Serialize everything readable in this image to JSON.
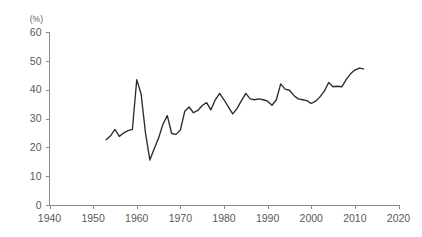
{
  "chart_data": {
    "type": "line",
    "title": "",
    "xlabel": "",
    "ylabel": "(%)",
    "unit_label": "(%)",
    "xlim": [
      1940,
      2020
    ],
    "ylim": [
      0,
      60
    ],
    "xticks": [
      1940,
      1950,
      1960,
      1970,
      1980,
      1990,
      2000,
      2010,
      2020
    ],
    "yticks": [
      0,
      10,
      20,
      30,
      40,
      50,
      60
    ],
    "xtick_labels": [
      "1940",
      "1950",
      "1960",
      "1970",
      "1980",
      "1990",
      "2000",
      "2010",
      "2020"
    ],
    "ytick_labels": [
      "0",
      "10",
      "20",
      "30",
      "40",
      "50",
      "60"
    ],
    "grid": false,
    "legend": false,
    "legend_position": "none",
    "line_color": "#2b2b2b",
    "axis_color": "#8a8a8a",
    "series": [
      {
        "name": "value",
        "x": [
          1953,
          1954,
          1955,
          1956,
          1957,
          1958,
          1959,
          1960,
          1961,
          1962,
          1963,
          1964,
          1965,
          1966,
          1967,
          1968,
          1969,
          1970,
          1971,
          1972,
          1973,
          1974,
          1975,
          1976,
          1977,
          1978,
          1979,
          1980,
          1981,
          1982,
          1983,
          1984,
          1985,
          1986,
          1987,
          1988,
          1989,
          1990,
          1991,
          1992,
          1993,
          1994,
          1995,
          1996,
          1997,
          1998,
          1999,
          2000,
          2001,
          2002,
          2003,
          2004,
          2005,
          2006,
          2007,
          2008,
          2009,
          2010,
          2011,
          2012
        ],
        "values": [
          22.6,
          24.0,
          26.2,
          23.8,
          25.0,
          25.8,
          26.2,
          43.5,
          38.5,
          25.0,
          15.6,
          19.5,
          23.2,
          28.0,
          31.0,
          24.8,
          24.5,
          26.0,
          32.5,
          34.0,
          32.0,
          32.8,
          34.5,
          35.5,
          33.0,
          36.5,
          38.7,
          36.5,
          34.0,
          31.6,
          33.5,
          36.2,
          38.7,
          36.8,
          36.5,
          36.8,
          36.5,
          36.0,
          34.6,
          36.5,
          42.0,
          40.2,
          39.8,
          38.0,
          36.8,
          36.5,
          36.2,
          35.2,
          36.0,
          37.5,
          39.5,
          42.5,
          41.0,
          41.2,
          41.0,
          43.5,
          45.5,
          46.8,
          47.5,
          47.2
        ]
      }
    ]
  },
  "axis": {
    "y_unit": "(%)"
  }
}
